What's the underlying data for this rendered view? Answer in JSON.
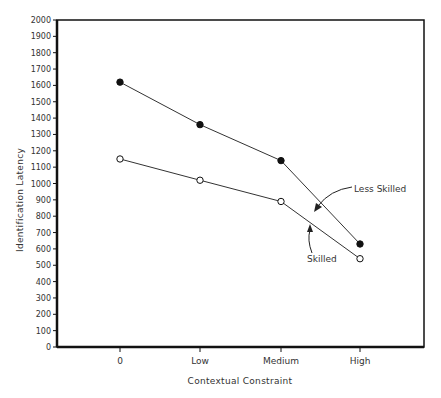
{
  "chart_data": {
    "type": "line",
    "title": "",
    "xlabel": "Contextual Constraint",
    "ylabel": "Identification Latency",
    "categories": [
      "0",
      "Low",
      "Medium",
      "High"
    ],
    "ylim": [
      0,
      2000
    ],
    "yticks": [
      0,
      100,
      200,
      300,
      400,
      500,
      600,
      700,
      800,
      900,
      1000,
      1100,
      1200,
      1300,
      1400,
      1500,
      1600,
      1700,
      1800,
      1900,
      2000
    ],
    "grid": false,
    "legend": "none (inline annotations)",
    "series": [
      {
        "name": "Less Skilled",
        "marker": "filled-circle",
        "values": [
          1620,
          1360,
          1140,
          630
        ]
      },
      {
        "name": "Skilled",
        "marker": "open-circle",
        "values": [
          1150,
          1020,
          890,
          540
        ]
      }
    ],
    "annotations": [
      {
        "text": "Less Skilled",
        "arrow_to_series": "Less Skilled"
      },
      {
        "text": "Skilled",
        "arrow_to_series": "Skilled"
      }
    ]
  },
  "labels": {
    "xlabel": "Contextual Constraint",
    "ylabel": "Identification Latency",
    "annot_less": "Less Skilled",
    "annot_skilled": "Skilled"
  },
  "colors": {
    "line": "#333333",
    "axis": "#111111"
  }
}
